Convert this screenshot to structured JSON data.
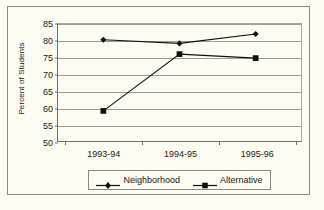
{
  "chart_data": {
    "type": "line",
    "title": "",
    "xlabel": "",
    "ylabel": "Percent of Students",
    "categories": [
      "1993-94",
      "1994-95",
      "1995-96"
    ],
    "ylim": [
      50,
      85
    ],
    "yticks": [
      50,
      55,
      60,
      65,
      70,
      75,
      80,
      85
    ],
    "ytick_labels": [
      "50",
      "55",
      "60",
      "65",
      "70",
      "75",
      "80",
      "85"
    ],
    "grid": true,
    "legend_position": "bottom",
    "series": [
      {
        "name": "Neighborhood",
        "marker": "diamond",
        "color": "#111111",
        "values": [
          80.3,
          79.2,
          82.0
        ]
      },
      {
        "name": "Alternative",
        "marker": "square",
        "color": "#111111",
        "values": [
          59.0,
          76.0,
          74.8
        ]
      }
    ]
  },
  "colors": {
    "background": "#fdfcf3",
    "gridline": "#9e9d91",
    "axis": "#706f63",
    "border": "#8a8a7e",
    "text": "#19190f",
    "series": "#111111"
  }
}
